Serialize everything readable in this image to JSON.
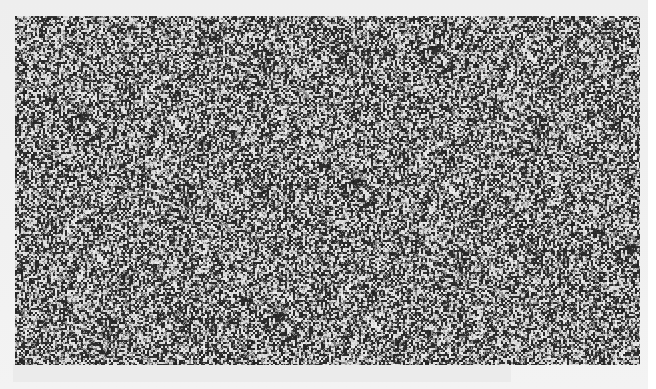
{
  "image": {
    "description": "Scanned random-dot noise pattern",
    "content_type": "random-noise",
    "palette": {
      "dark": "#2a2a2a",
      "mid": "#8a8a8a",
      "light": "#e8e8e8",
      "page": "#f0f0f0"
    }
  }
}
